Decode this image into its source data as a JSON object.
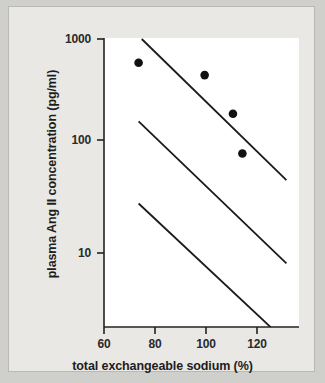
{
  "chart_data": {
    "type": "scatter",
    "title": "",
    "xlabel": "total exchangeable sodium (%)",
    "ylabel": "plasma Ang II concentration (pg/ml)",
    "xlim": [
      60,
      122
    ],
    "ylim": [
      3,
      1000
    ],
    "yscale": "log",
    "xscale": "linear",
    "grid": false,
    "legend": null,
    "xticks": [
      60,
      80,
      100,
      120
    ],
    "xtick_labels": [
      "60",
      "80",
      "100",
      "120"
    ],
    "yticks": [
      10,
      100,
      1000
    ],
    "ytick_labels": [
      "10",
      "100",
      "1000"
    ],
    "points": [
      {
        "x": 71,
        "y": 600
      },
      {
        "x": 92,
        "y": 460
      },
      {
        "x": 101,
        "y": 200
      },
      {
        "x": 104,
        "y": 85
      }
    ],
    "lines": [
      {
        "name": "upper-regression-line",
        "x": [
          72,
          118
        ],
        "y": [
          1000,
          48
        ]
      },
      {
        "name": "middle-regression-line",
        "x": [
          71,
          118
        ],
        "y": [
          170,
          8
        ]
      },
      {
        "name": "lower-regression-line",
        "x": [
          71,
          120
        ],
        "y": [
          29,
          1.3
        ]
      }
    ],
    "marker_color": "#111111",
    "line_color": "#1a1a1a",
    "plot_background": "#ffffff",
    "page_background": "#e9e8e4"
  }
}
